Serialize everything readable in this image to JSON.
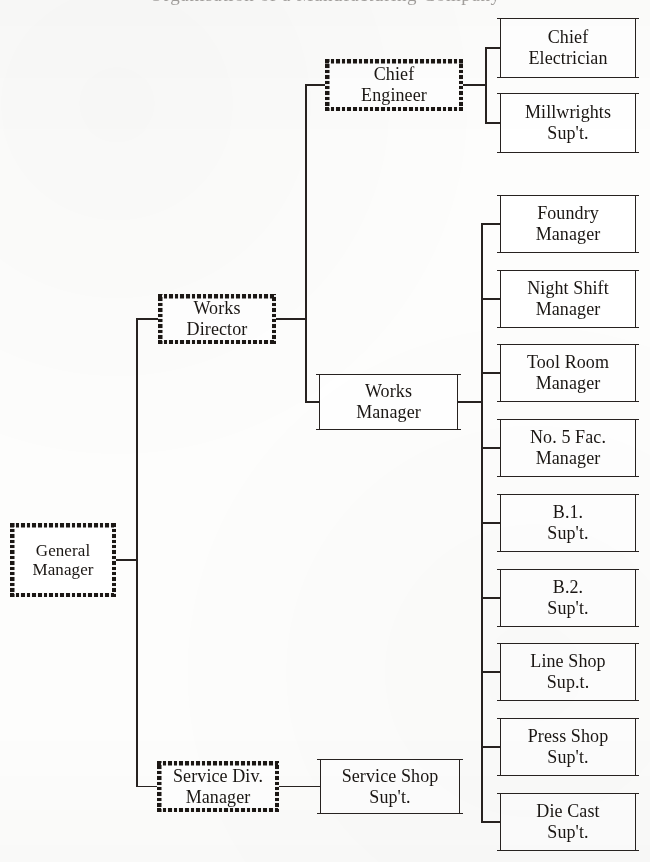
{
  "chart_title_sliver": "Organisation of a Manufacturing Company",
  "chart_data": {
    "type": "diagram",
    "diagram_kind": "organisation-chart",
    "orientation": "left-to-right",
    "root": "General Manager",
    "nodes": [
      {
        "id": "general-manager",
        "label": "General\nManager",
        "style": "hatched",
        "level": 0,
        "x": 10,
        "y": 523,
        "w": 106,
        "h": 74
      },
      {
        "id": "works-director",
        "label": "Works\nDirector",
        "style": "hatched",
        "level": 1,
        "x": 158,
        "y": 294,
        "w": 118,
        "h": 50
      },
      {
        "id": "service-div-manager",
        "label": "Service Div.\nManager",
        "style": "hatched",
        "level": 1,
        "x": 157,
        "y": 761,
        "w": 122,
        "h": 51
      },
      {
        "id": "chief-engineer",
        "label": "Chief\nEngineer",
        "style": "hatched",
        "level": 2,
        "x": 325,
        "y": 59,
        "w": 138,
        "h": 52
      },
      {
        "id": "works-manager",
        "label": "Works\nManager",
        "style": "plain",
        "level": 2,
        "x": 319,
        "y": 375,
        "w": 139,
        "h": 54
      },
      {
        "id": "service-shop-supt",
        "label": "Service Shop\nSup't.",
        "style": "plain",
        "level": 2,
        "x": 320,
        "y": 760,
        "w": 140,
        "h": 53
      },
      {
        "id": "chief-electrician",
        "label": "Chief\nElectrician",
        "style": "plain",
        "level": 3,
        "x": 500,
        "y": 19,
        "w": 136,
        "h": 58
      },
      {
        "id": "millwrights-supt",
        "label": "Millwrights\nSup't.",
        "style": "plain",
        "level": 3,
        "x": 500,
        "y": 94,
        "w": 136,
        "h": 58
      },
      {
        "id": "foundry-manager",
        "label": "Foundry\nManager",
        "style": "plain",
        "level": 3,
        "x": 500,
        "y": 196,
        "w": 136,
        "h": 56
      },
      {
        "id": "night-shift-manager",
        "label": "Night Shift\nManager",
        "style": "plain",
        "level": 3,
        "x": 500,
        "y": 271,
        "w": 136,
        "h": 56
      },
      {
        "id": "tool-room-manager",
        "label": "Tool Room\nManager",
        "style": "plain",
        "level": 3,
        "x": 500,
        "y": 345,
        "w": 136,
        "h": 56
      },
      {
        "id": "no5-fac-manager",
        "label": "No. 5 Fac.\nManager",
        "style": "plain",
        "level": 3,
        "x": 500,
        "y": 420,
        "w": 136,
        "h": 56
      },
      {
        "id": "b1-supt",
        "label": "B.1.\nSup't.",
        "style": "plain",
        "level": 3,
        "x": 500,
        "y": 495,
        "w": 136,
        "h": 56
      },
      {
        "id": "b2-supt",
        "label": "B.2.\nSup't.",
        "style": "plain",
        "level": 3,
        "x": 500,
        "y": 570,
        "w": 136,
        "h": 56
      },
      {
        "id": "line-shop-supt",
        "label": "Line Shop\nSup.t.",
        "style": "plain",
        "level": 3,
        "x": 500,
        "y": 644,
        "w": 136,
        "h": 56
      },
      {
        "id": "press-shop-supt",
        "label": "Press Shop\nSup't.",
        "style": "plain",
        "level": 3,
        "x": 500,
        "y": 719,
        "w": 136,
        "h": 56
      },
      {
        "id": "die-cast-supt",
        "label": "Die Cast\nSup't.",
        "style": "plain",
        "level": 3,
        "x": 500,
        "y": 794,
        "w": 136,
        "h": 56
      }
    ],
    "edges": [
      {
        "from": "general-manager",
        "to": "works-director"
      },
      {
        "from": "general-manager",
        "to": "service-div-manager"
      },
      {
        "from": "works-director",
        "to": "chief-engineer"
      },
      {
        "from": "works-director",
        "to": "works-manager"
      },
      {
        "from": "service-div-manager",
        "to": "service-shop-supt"
      },
      {
        "from": "chief-engineer",
        "to": "chief-electrician"
      },
      {
        "from": "chief-engineer",
        "to": "millwrights-supt"
      },
      {
        "from": "works-manager",
        "to": "foundry-manager"
      },
      {
        "from": "works-manager",
        "to": "night-shift-manager"
      },
      {
        "from": "works-manager",
        "to": "tool-room-manager"
      },
      {
        "from": "works-manager",
        "to": "no5-fac-manager"
      },
      {
        "from": "works-manager",
        "to": "b1-supt"
      },
      {
        "from": "works-manager",
        "to": "b2-supt"
      },
      {
        "from": "works-manager",
        "to": "line-shop-supt"
      },
      {
        "from": "works-manager",
        "to": "press-shop-supt"
      },
      {
        "from": "works-manager",
        "to": "die-cast-supt"
      }
    ],
    "ink_color": "#272220",
    "page_color": "#fdfdfc",
    "font_sizes": {
      "node_default": 18,
      "node_root": 17
    }
  },
  "connectors": {
    "gm_trunk": {
      "x": 136,
      "y": 320,
      "h": 467
    },
    "gm_stub": {
      "x": 116,
      "y": 559,
      "w": 21
    },
    "wd_trunk": {
      "x": 305,
      "y": 86,
      "h": 317
    },
    "ce_trunk": {
      "x": 485,
      "y": 48,
      "h": 76
    },
    "wm_trunk": {
      "x": 481,
      "y": 224,
      "h": 598
    }
  }
}
